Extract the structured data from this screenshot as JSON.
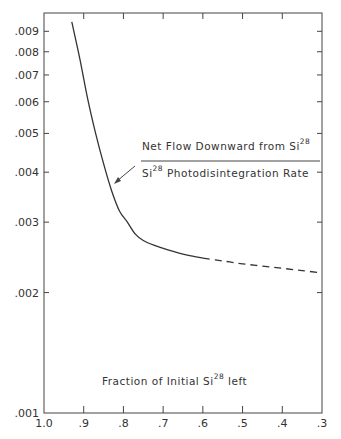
{
  "chart_data": {
    "type": "line",
    "title": "",
    "xlabel": "Fraction of Initial Si28 left",
    "ylabel": "",
    "x_scale": "linear-reversed",
    "y_scale": "log",
    "xlim": [
      1.0,
      0.3
    ],
    "ylim": [
      0.001,
      0.01
    ],
    "grid": false,
    "x_ticks": [
      "1.0",
      ".9",
      ".8",
      ".7",
      ".6",
      ".5",
      ".4",
      ".3"
    ],
    "y_ticks": [
      ".001",
      ".002",
      ".003",
      ".004",
      ".005",
      ".006",
      ".007",
      ".008",
      ".009"
    ],
    "series": [
      {
        "name": "Net Flow Downward from Si28 / Si28 Photodisintegration Rate",
        "style": "solid",
        "x": [
          0.93,
          0.91,
          0.89,
          0.87,
          0.85,
          0.83,
          0.81,
          0.79,
          0.77,
          0.75,
          0.72,
          0.69,
          0.66,
          0.63,
          0.6
        ],
        "y": [
          0.0095,
          0.0077,
          0.0061,
          0.005,
          0.0042,
          0.0036,
          0.0032,
          0.003,
          0.0028,
          0.0027,
          0.00262,
          0.00256,
          0.00251,
          0.00247,
          0.00244
        ]
      },
      {
        "name": "extrapolation",
        "style": "dashed",
        "x": [
          0.6,
          0.55,
          0.5,
          0.45,
          0.4,
          0.35,
          0.3
        ],
        "y": [
          0.00244,
          0.0024,
          0.00236,
          0.00233,
          0.0023,
          0.00227,
          0.00224
        ]
      }
    ],
    "annotations": [
      {
        "numerator": "Net Flow Downward from Si",
        "numerator_sup": "28",
        "denominator_pre": "Si",
        "denominator_sup": "28",
        "denominator": " Photodisintegration Rate"
      },
      {
        "axis_label_main": "Fraction of Initial Si",
        "axis_label_sup": "28",
        "axis_label_tail": " left"
      }
    ]
  }
}
